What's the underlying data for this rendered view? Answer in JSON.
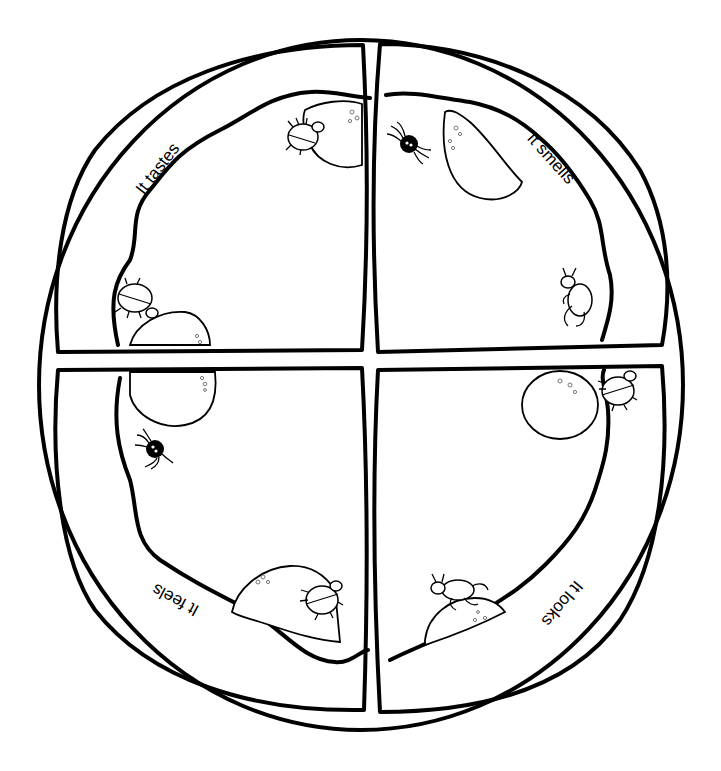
{
  "worksheet": {
    "title": "Pizza senses worksheet",
    "colors": {
      "ink": "#000000",
      "paper": "#ffffff"
    },
    "plate": {
      "cx": 361,
      "cy": 385,
      "rx": 322,
      "ry": 345
    },
    "quadrants": [
      {
        "id": "top-left",
        "label": "It tastes",
        "rotation": -52,
        "x": 162,
        "y": 172
      },
      {
        "id": "top-right",
        "label": "It smells",
        "rotation": 48,
        "x": 547,
        "y": 162
      },
      {
        "id": "bottom-left",
        "label": "It feels",
        "rotation": 208,
        "x": 178,
        "y": 595
      },
      {
        "id": "bottom-right",
        "label": "It looks",
        "rotation": 130,
        "x": 558,
        "y": 600
      }
    ],
    "decorations": {
      "top-left": [
        "pepperoni",
        "ladybug",
        "pepperoni",
        "ladybug"
      ],
      "top-right": [
        "spider",
        "pepperoni",
        "ant"
      ],
      "bottom-left": [
        "pepperoni",
        "spider",
        "pepperoni",
        "ladybug"
      ],
      "bottom-right": [
        "pepperoni",
        "ladybug",
        "ant",
        "pepperoni"
      ]
    }
  }
}
